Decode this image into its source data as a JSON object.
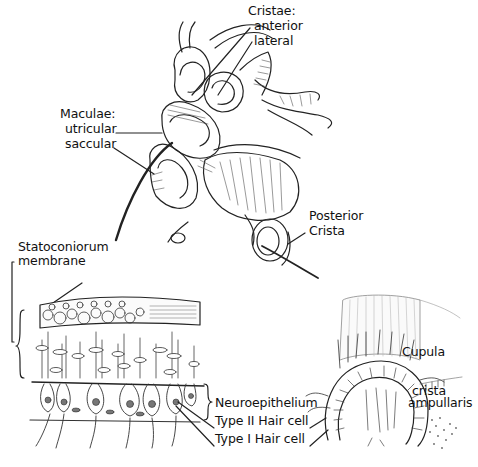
{
  "diagram": {
    "labels": {
      "cristae_heading": "Cristae:",
      "cristae_anterior": "anterior",
      "cristae_lateral": "lateral",
      "maculae_heading": "Maculae:",
      "maculae_utricular": "utricular",
      "maculae_saccular": "saccular",
      "posterior": "Posterior",
      "crista": "Crista",
      "statoconiorum": "Statoconiorum",
      "membrane": "membrane",
      "neuroepithelium": "Neuroepithelium",
      "type2": "Type II Hair cell",
      "type1": "Type I Hair cell",
      "cupula": "Cupula",
      "crista_word": "crista",
      "ampullaris": "ampullaris"
    },
    "colors": {
      "background": "#ffffff",
      "ink": "#111111"
    }
  }
}
